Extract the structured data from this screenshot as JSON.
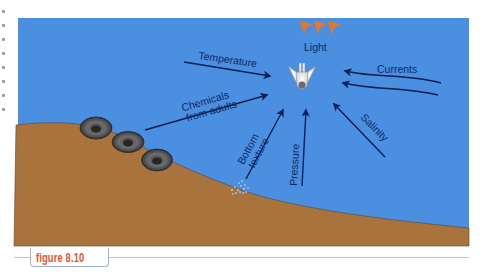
{
  "figure": {
    "caption": "figure 8.10",
    "colors": {
      "water": "#4a8fe0",
      "seabed": "#a9733d",
      "arrow": "#0c1f52",
      "label": "#0f2a63",
      "light_rays": "#e8762a",
      "caption": "#e0562a"
    }
  },
  "labels": {
    "light": "Light",
    "temperature": "Temperature",
    "chemicals_line1": "Chemicals",
    "chemicals_line2": "from adults",
    "bottom_line1": "Bottom",
    "bottom_line2": "texture",
    "pressure": "Pressure",
    "salinity": "Salinity",
    "currents": "Currents"
  },
  "elements": {
    "larva": "settling larva",
    "adults": [
      "adult barnacle 1",
      "adult barnacle 2",
      "adult barnacle 3"
    ],
    "substrate": "sediment patch"
  }
}
